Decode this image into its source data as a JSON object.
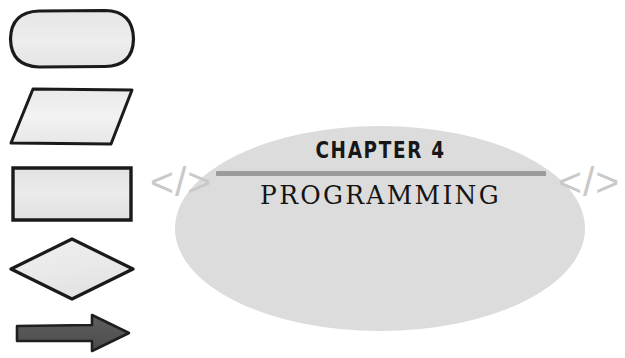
{
  "page": {
    "background_color": "#ffffff",
    "width": 625,
    "height": 358
  },
  "emblem": {
    "ellipse_color": "#dcdcdc",
    "divider_color": "#9b9b9b",
    "chapter_number": "CHAPTER 4",
    "chapter_title": "PROGRAMMING",
    "bracket_left": "</>",
    "bracket_right": "</>",
    "bracket_color": "#c9c9c9"
  },
  "shapes": {
    "outline_color": "#1a1a1a",
    "fill_color": "#ececec",
    "arrow_color": "#5a5a5a",
    "items": [
      {
        "name": "terminator",
        "label": "rounded-rectangle"
      },
      {
        "name": "input-output",
        "label": "parallelogram"
      },
      {
        "name": "process",
        "label": "rectangle"
      },
      {
        "name": "decision",
        "label": "diamond"
      },
      {
        "name": "flow-arrow",
        "label": "arrow"
      }
    ]
  }
}
